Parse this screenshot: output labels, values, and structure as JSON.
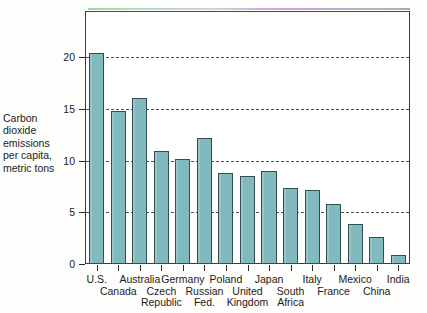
{
  "chart_data": {
    "type": "bar",
    "title": "",
    "subtitle": "",
    "xlabel": "",
    "ylabel": "Carbon dioxide emissions per capita, metric tons",
    "ylabel_lines": [
      "Carbon",
      "dioxide",
      "emissions",
      "per capita,",
      "metric tons"
    ],
    "categories": [
      "U.S.",
      "Canada",
      "Australia",
      "Czech Republic",
      "Germany",
      "Russian Fed.",
      "Poland",
      "United Kingdom",
      "Japan",
      "South Africa",
      "Italy",
      "France",
      "Mexico",
      "China",
      "India"
    ],
    "category_label_lines": [
      [
        "U.S."
      ],
      [
        "Canada"
      ],
      [
        "Australia"
      ],
      [
        "Czech",
        "Republic"
      ],
      [
        "Germany"
      ],
      [
        "Russian",
        "Fed."
      ],
      [
        "Poland"
      ],
      [
        "United",
        "Kingdom"
      ],
      [
        "Japan"
      ],
      [
        "South",
        "Africa"
      ],
      [
        "Italy"
      ],
      [
        "France"
      ],
      [
        "Mexico"
      ],
      [
        "China"
      ],
      [
        "India"
      ]
    ],
    "values": [
      20.4,
      14.8,
      16.1,
      10.9,
      10.2,
      12.2,
      8.8,
      8.5,
      9.0,
      7.4,
      7.2,
      5.8,
      3.9,
      2.6,
      0.85
    ],
    "ylim": [
      0,
      24.5
    ],
    "yticks": [
      0,
      5,
      10,
      15,
      20
    ],
    "ytick_labels": [
      "0",
      "5",
      "10",
      "15",
      "20"
    ],
    "gridlines_at": [
      5,
      10,
      15,
      20
    ],
    "grid": true,
    "grid_style": "dashed",
    "legend": null,
    "legend_position": "none",
    "bar_fill_color": "#81b9bd",
    "bar_edge_color": "#2f4f52",
    "axis_color": "#3a3a3a",
    "background_color": "#fdfdfb",
    "plot_background_color": "#ffffff"
  }
}
